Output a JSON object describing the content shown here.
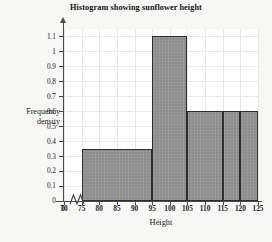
{
  "chart_data": {
    "type": "bar",
    "title": "Histogram showing sunflower height",
    "xlabel": "Height",
    "ylabel": "Frequency density",
    "ylabel_line1": "Frequency",
    "ylabel_line2": "density",
    "grid": true,
    "legend": "none",
    "xlim": [
      70,
      125
    ],
    "ylim": [
      0,
      1.15
    ],
    "axis_break": true,
    "axis_break_note": "x-axis broken between 0 and 70",
    "xticks": [
      "0",
      "70",
      "75",
      "80",
      "85",
      "90",
      "95",
      "100",
      "105",
      "110",
      "115",
      "120",
      "125"
    ],
    "yticks": [
      "0",
      "0.1",
      "0.2",
      "0.3",
      "0.4",
      "0.5",
      "0.6",
      "0.7",
      "0.8",
      "0.9",
      "1",
      "1.1"
    ],
    "bins": [
      {
        "start": 75,
        "end": 95,
        "frequency_density": 0.35
      },
      {
        "start": 95,
        "end": 105,
        "frequency_density": 1.1
      },
      {
        "start": 105,
        "end": 115,
        "frequency_density": 0.6
      },
      {
        "start": 115,
        "end": 120,
        "frequency_density": 0.6
      },
      {
        "start": 120,
        "end": 125,
        "frequency_density": 0.6
      }
    ],
    "bar_fill_color": "#8b8b8b",
    "bar_border_color": "#2d2d2d",
    "grid_color": "#e9e9e9",
    "axis_color": "#4a4a4a",
    "background_color": "#f7f7f5",
    "plot_background_color": "#ffffff"
  }
}
